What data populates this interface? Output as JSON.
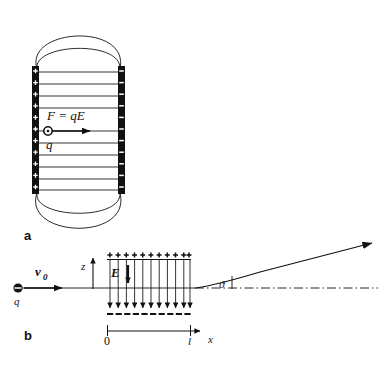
{
  "figure": {
    "background_color": "#ffffff",
    "line_color": "#111111",
    "panels": [
      {
        "id": "a",
        "label": "a",
        "description": "Parallel-plate capacitor with fringing field lines and charge q experiencing force F = qE"
      },
      {
        "id": "b",
        "label": "b",
        "description": "Charge q entering capacitor with velocity v0 and deflected by angle theta"
      }
    ]
  },
  "panel_a": {
    "label": "a",
    "force_label": "F = qE",
    "charge_label": "q",
    "plate_left": {
      "name": "positive-plate",
      "sign": "+",
      "marks": 11
    },
    "plate_right": {
      "name": "negative-plate",
      "sign": "–",
      "marks": 11
    },
    "field_lines_count": 11,
    "fringe_arcs_top": 2,
    "fringe_arcs_bottom": 2
  },
  "panel_b": {
    "label": "b",
    "velocity_label": "v",
    "velocity_subscript": "0",
    "charge_label": "q",
    "z_axis_label": "z",
    "x_axis_label": "x",
    "field_label": "E",
    "angle_label": "ϑ",
    "origin_tick_label": "0",
    "length_tick_label": "l",
    "top_plate_sign": "+",
    "top_plate_marks": 11,
    "bottom_plate_sign": "–",
    "bottom_plate_marks": 11,
    "field_arrows_count": 11
  }
}
